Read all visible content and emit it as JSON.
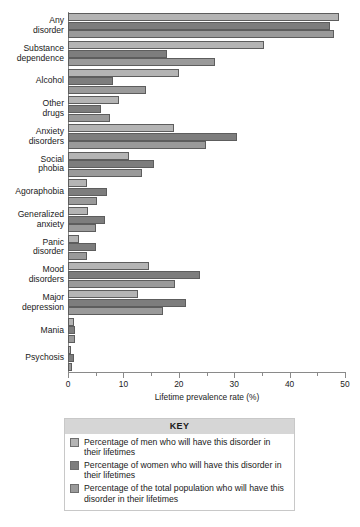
{
  "chart_data": {
    "type": "bar",
    "orientation": "horizontal",
    "title": "",
    "xlabel": "Lifetime prevalence rate (%)",
    "ylabel": "",
    "xlim": [
      0,
      50
    ],
    "xticks": [
      0,
      10,
      20,
      30,
      40,
      50
    ],
    "xtick_labels": [
      "0",
      "10",
      "20",
      "30",
      "40",
      "50"
    ],
    "xminorticks": [
      5,
      15,
      25,
      35,
      45
    ],
    "grid": false,
    "legend_position": "bottom",
    "categories": [
      "Any\ndisorder",
      "Substance\ndependence",
      "Alcohol",
      "Other\ndrugs",
      "Anxiety\ndisorders",
      "Social\nphobia",
      "Agoraphobia",
      "Generalized\nanxiety",
      "Panic\ndisorder",
      "Mood\ndisorders",
      "Major\ndepression",
      "Mania",
      "Psychosis"
    ],
    "series": [
      {
        "name": "Percentage of men who will have this disorder in their lifetimes",
        "key": "men",
        "color": "#b4b4b4",
        "values": [
          49.0,
          35.4,
          20.1,
          9.2,
          19.2,
          11.1,
          3.5,
          3.6,
          2.0,
          14.7,
          12.7,
          1.1,
          0.6
        ]
      },
      {
        "name": "Percentage of women who will have this disorder in their lifetimes",
        "key": "women",
        "color": "#7d7d7d",
        "values": [
          47.3,
          17.9,
          8.2,
          5.9,
          30.5,
          15.5,
          7.0,
          6.6,
          5.0,
          23.9,
          21.3,
          1.3,
          1.0
        ]
      },
      {
        "name": "Percentage of the total population who will have this disorder in their lifetimes",
        "key": "total",
        "color": "#9a9a9a",
        "values": [
          48.0,
          26.6,
          14.1,
          7.5,
          24.9,
          13.3,
          5.3,
          5.1,
          3.5,
          19.3,
          17.1,
          1.2,
          0.7
        ]
      }
    ]
  },
  "key": {
    "title": "KEY",
    "items": [
      {
        "swatch": "men",
        "label": "Percentage of men who will have this disorder in their lifetimes"
      },
      {
        "swatch": "women",
        "label": "Percentage of women who will have this disorder in their lifetimes"
      },
      {
        "swatch": "total",
        "label": "Percentage of the total population who will have this disorder in their lifetimes"
      }
    ]
  }
}
